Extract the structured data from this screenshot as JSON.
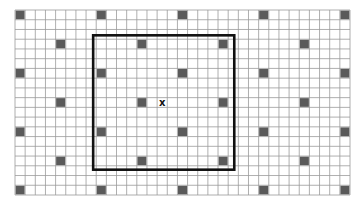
{
  "grid": {
    "columns": 33,
    "rows": 19,
    "line_color": "#9a9a9a",
    "cell_fill": "#ffffff",
    "dark_cell_color": "#5a5a5a"
  },
  "dark_cells": {
    "lattice_a": {
      "rows": [
        0,
        6,
        12,
        18
      ],
      "cols": [
        0,
        8,
        16,
        24,
        32
      ]
    },
    "lattice_b": {
      "rows": [
        3,
        9,
        15
      ],
      "cols": [
        4,
        12,
        20,
        28
      ]
    }
  },
  "selection_box": {
    "from_cell": [
      7.7,
      2.6
    ],
    "to_cell": [
      21.6,
      16.4
    ],
    "color": "#111111"
  },
  "marker": {
    "label": "x",
    "cell": [
      14,
      9
    ]
  }
}
